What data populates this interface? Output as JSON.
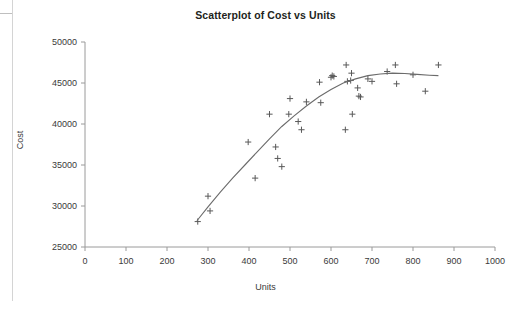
{
  "chart_data": {
    "type": "scatter",
    "title": "Scatterplot of Cost vs Units",
    "xlabel": "Units",
    "ylabel": "Cost",
    "xlim": [
      0,
      1000
    ],
    "ylim": [
      25000,
      50000
    ],
    "xticks": [
      0,
      100,
      200,
      300,
      400,
      500,
      600,
      700,
      800,
      900,
      1000
    ],
    "yticks": [
      25000,
      30000,
      35000,
      40000,
      45000,
      50000
    ],
    "xtick_labels": [
      "0",
      "100",
      "200",
      "300",
      "400",
      "500",
      "600",
      "700",
      "800",
      "900",
      "1000"
    ],
    "ytick_labels": [
      "25000",
      "30000",
      "35000",
      "40000",
      "45000",
      "50000"
    ],
    "grid": false,
    "legend": false,
    "marker": "plus",
    "marker_color": "#595959",
    "curve_color": "#6b6b6b",
    "axis_color": "#9a9a9a",
    "series": [
      {
        "name": "Cost vs Units",
        "points": [
          [
            275,
            28100
          ],
          [
            300,
            31200
          ],
          [
            305,
            29400
          ],
          [
            398,
            37800
          ],
          [
            415,
            33400
          ],
          [
            450,
            41200
          ],
          [
            465,
            37200
          ],
          [
            470,
            35800
          ],
          [
            480,
            34800
          ],
          [
            497,
            41200
          ],
          [
            500,
            43100
          ],
          [
            520,
            40300
          ],
          [
            528,
            39300
          ],
          [
            540,
            42700
          ],
          [
            572,
            45100
          ],
          [
            575,
            42600
          ],
          [
            600,
            45700
          ],
          [
            603,
            45900
          ],
          [
            607,
            45800
          ],
          [
            637,
            47200
          ],
          [
            635,
            39300
          ],
          [
            640,
            45200
          ],
          [
            648,
            45300
          ],
          [
            650,
            46200
          ],
          [
            652,
            41200
          ],
          [
            665,
            44400
          ],
          [
            668,
            43400
          ],
          [
            672,
            43300
          ],
          [
            690,
            45500
          ],
          [
            700,
            45200
          ],
          [
            737,
            46400
          ],
          [
            757,
            47200
          ],
          [
            760,
            44900
          ],
          [
            800,
            46000
          ],
          [
            830,
            44000
          ],
          [
            862,
            47200
          ]
        ]
      }
    ],
    "fit_curve": {
      "name": "quadratic trend",
      "points": [
        [
          273,
          28200
        ],
        [
          300,
          29900
        ],
        [
          330,
          31700
        ],
        [
          360,
          33400
        ],
        [
          390,
          35000
        ],
        [
          420,
          36600
        ],
        [
          450,
          38200
        ],
        [
          480,
          39700
        ],
        [
          510,
          41000
        ],
        [
          540,
          42200
        ],
        [
          570,
          43300
        ],
        [
          600,
          44200
        ],
        [
          630,
          45000
        ],
        [
          660,
          45500
        ],
        [
          690,
          45900
        ],
        [
          720,
          46100
        ],
        [
          750,
          46200
        ],
        [
          780,
          46150
        ],
        [
          810,
          46050
        ],
        [
          840,
          45950
        ],
        [
          862,
          45900
        ]
      ]
    }
  }
}
